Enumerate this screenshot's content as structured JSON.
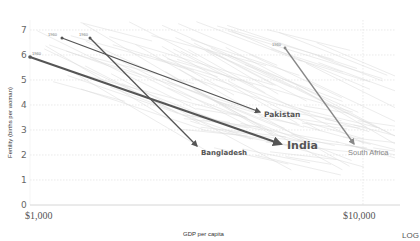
{
  "chart_data": {
    "type": "scatter",
    "title": "",
    "xlabel": "GDP per capita",
    "ylabel": "Fertility (births per woman)",
    "xscale": "log",
    "scale_toggle_label": "LOG",
    "xlim": [
      1000,
      13000
    ],
    "ylim": [
      0,
      7.5
    ],
    "x_ticks": [
      "$1,000",
      "$10,000"
    ],
    "y_ticks": [
      "0",
      "1",
      "2",
      "3",
      "4",
      "5",
      "6",
      "7"
    ],
    "grid": true,
    "series": [
      {
        "name": "India",
        "start_year": "1960",
        "start": {
          "gdp": 1000,
          "fertility": 5.9
        },
        "end": {
          "gdp": 5700,
          "fertility": 2.4
        },
        "color": "#555555",
        "label_size": "large"
      },
      {
        "name": "Pakistan",
        "start_year": "1960",
        "start": {
          "gdp": 1250,
          "fertility": 6.6
        },
        "end": {
          "gdp": 4900,
          "fertility": 3.6
        },
        "color": "#555555",
        "label_size": "medium"
      },
      {
        "name": "Bangladesh",
        "start_year": "1960",
        "start": {
          "gdp": 1500,
          "fertility": 6.6
        },
        "end": {
          "gdp": 3400,
          "fertility": 2.2
        },
        "color": "#555555",
        "label_size": "medium"
      },
      {
        "name": "South Africa",
        "start_year": "1960",
        "start": {
          "gdp": 7200,
          "fertility": 6.2
        },
        "end": {
          "gdp": 11600,
          "fertility": 2.3
        },
        "color": "#888888",
        "label_size": "medium"
      }
    ],
    "background_trails": "many faint grey country trajectories trending downward from high fertility/low GDP to low fertility/high GDP"
  }
}
